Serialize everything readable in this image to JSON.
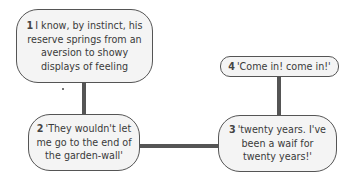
{
  "diagram": {
    "type": "flow",
    "nodes": [
      {
        "id": 1,
        "number": "1",
        "text": "I know, by instinct, his reserve springs from an aversion to showy displays of feeling"
      },
      {
        "id": 2,
        "number": "2",
        "text": "'They wouldn't let me go to the end of the garden-wall'"
      },
      {
        "id": 3,
        "number": "3",
        "text": "'twenty years. I've been a waif for twenty years!'"
      },
      {
        "id": 4,
        "number": "4",
        "text": "'Come in! come in!'"
      }
    ],
    "edges": [
      {
        "from": 1,
        "to": 2
      },
      {
        "from": 2,
        "to": 3
      },
      {
        "from": 4,
        "to": 3
      }
    ],
    "colors": {
      "line": "#555555",
      "node_fill": "#f4f4f4",
      "text": "#3a3a3a"
    }
  }
}
